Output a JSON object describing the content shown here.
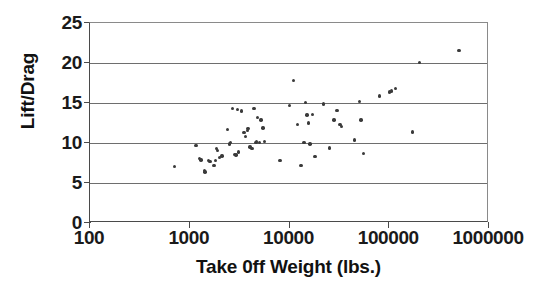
{
  "chart_data": {
    "type": "scatter",
    "title": "",
    "xlabel": "Take 0ff Weight (lbs.)",
    "ylabel": "Lift/Drag",
    "xscale": "log",
    "yscale": "linear",
    "xlim": [
      100,
      1000000
    ],
    "ylim": [
      0,
      25
    ],
    "xticks": [
      100,
      1000,
      10000,
      100000,
      1000000
    ],
    "xtick_labels": [
      "100",
      "1000",
      "10000",
      "100000",
      "1000000"
    ],
    "yticks": [
      0,
      5,
      10,
      15,
      20,
      25
    ],
    "ytick_labels": [
      "0",
      "5",
      "10",
      "15",
      "20",
      "25"
    ],
    "grid": "horizontal",
    "legend": "none",
    "marker": "filled-diamond",
    "marker_color": "#3a3a3a",
    "series": [
      {
        "name": "Aircraft",
        "points": [
          [
            700,
            7.1
          ],
          [
            1150,
            9.7
          ],
          [
            1250,
            8.1
          ],
          [
            1300,
            7.9
          ],
          [
            1400,
            6.6
          ],
          [
            1420,
            6.4
          ],
          [
            1550,
            7.8
          ],
          [
            1600,
            7.7
          ],
          [
            1750,
            7.2
          ],
          [
            1800,
            7.8
          ],
          [
            1850,
            9.3
          ],
          [
            1900,
            9.1
          ],
          [
            2000,
            8.2
          ],
          [
            2100,
            8.4
          ],
          [
            2400,
            11.7
          ],
          [
            2500,
            9.9
          ],
          [
            2550,
            10.1
          ],
          [
            2700,
            14.3
          ],
          [
            2800,
            8.6
          ],
          [
            2900,
            8.5
          ],
          [
            3000,
            14.2
          ],
          [
            3100,
            8.9
          ],
          [
            3300,
            14.0
          ],
          [
            3500,
            11.3
          ],
          [
            3600,
            10.8
          ],
          [
            3800,
            11.6
          ],
          [
            3850,
            11.8
          ],
          [
            4000,
            9.5
          ],
          [
            4200,
            9.3
          ],
          [
            4400,
            14.3
          ],
          [
            4600,
            10.1
          ],
          [
            4700,
            10.2
          ],
          [
            4800,
            13.2
          ],
          [
            5000,
            10.1
          ],
          [
            5200,
            12.9
          ],
          [
            5400,
            11.9
          ],
          [
            5600,
            10.2
          ],
          [
            8000,
            7.8
          ],
          [
            10000,
            14.7
          ],
          [
            11000,
            17.8
          ],
          [
            12000,
            12.3
          ],
          [
            13000,
            7.2
          ],
          [
            14000,
            10.1
          ],
          [
            14500,
            15.1
          ],
          [
            15000,
            13.5
          ],
          [
            15500,
            12.5
          ],
          [
            16000,
            9.9
          ],
          [
            17000,
            13.6
          ],
          [
            18000,
            8.3
          ],
          [
            22000,
            14.9
          ],
          [
            25000,
            9.4
          ],
          [
            28000,
            12.9
          ],
          [
            30000,
            14.1
          ],
          [
            32000,
            12.3
          ],
          [
            33000,
            12.1
          ],
          [
            45000,
            10.4
          ],
          [
            50000,
            15.2
          ],
          [
            52000,
            12.9
          ],
          [
            55000,
            8.7
          ],
          [
            80000,
            15.9
          ],
          [
            100000,
            16.4
          ],
          [
            105000,
            16.5
          ],
          [
            115000,
            16.8
          ],
          [
            170000,
            11.4
          ],
          [
            200000,
            20.1
          ],
          [
            500000,
            21.6
          ]
        ]
      }
    ]
  },
  "axes": {
    "y_title": "Lift/Drag",
    "x_title": "Take 0ff Weight (lbs.)"
  }
}
